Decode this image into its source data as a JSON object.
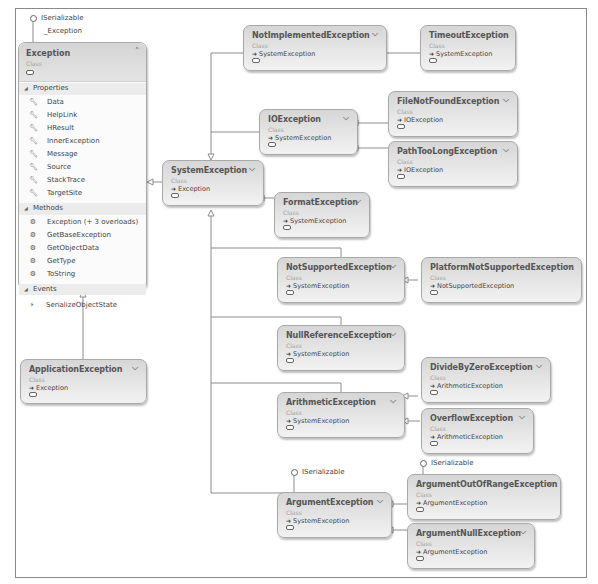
{
  "diagram": {
    "type": "class-diagram",
    "interface_label": "ISerializable",
    "exception_interface_label": "_Exception"
  },
  "exception": {
    "name": "Exception",
    "kind": "Class",
    "sections": {
      "properties": {
        "label": "Properties",
        "items": [
          "Data",
          "HelpLink",
          "HResult",
          "InnerException",
          "Message",
          "Source",
          "StackTrace",
          "TargetSite"
        ]
      },
      "methods": {
        "label": "Methods",
        "items": [
          "Exception (+ 3 overloads)",
          "GetBaseException",
          "GetObjectData",
          "GetType",
          "ToString"
        ]
      },
      "events": {
        "label": "Events",
        "items": [
          "SerializeObjectState"
        ]
      }
    }
  },
  "classes": [
    {
      "name": "ApplicationException",
      "kind": "Class",
      "base": "Exception"
    },
    {
      "name": "SystemException",
      "kind": "Class",
      "base": "Exception"
    },
    {
      "name": "NotImplementedException",
      "kind": "Class",
      "base": "SystemException"
    },
    {
      "name": "TimeoutException",
      "kind": "Class",
      "base": "SystemException"
    },
    {
      "name": "IOException",
      "kind": "Class",
      "base": "SystemException"
    },
    {
      "name": "FileNotFoundException",
      "kind": "Class",
      "base": "IOException"
    },
    {
      "name": "PathTooLongException",
      "kind": "Class",
      "base": "IOException"
    },
    {
      "name": "FormatException",
      "kind": "Class",
      "base": "SystemException"
    },
    {
      "name": "NotSupportedException",
      "kind": "Class",
      "base": "SystemException"
    },
    {
      "name": "PlatformNotSupportedException",
      "kind": "Class",
      "base": "NotSupportedException"
    },
    {
      "name": "NullReferenceException",
      "kind": "Class",
      "base": "SystemException"
    },
    {
      "name": "ArithmeticException",
      "kind": "Class",
      "base": "SystemException"
    },
    {
      "name": "DivideByZeroException",
      "kind": "Class",
      "base": "ArithmeticException"
    },
    {
      "name": "OverflowException",
      "kind": "Class",
      "base": "ArithmeticException"
    },
    {
      "name": "ArgumentException",
      "kind": "Class",
      "base": "SystemException"
    },
    {
      "name": "ArgumentOutOfRangeException",
      "kind": "Class",
      "base": "ArgumentException"
    },
    {
      "name": "ArgumentNullException",
      "kind": "Class",
      "base": "ArgumentException"
    }
  ]
}
